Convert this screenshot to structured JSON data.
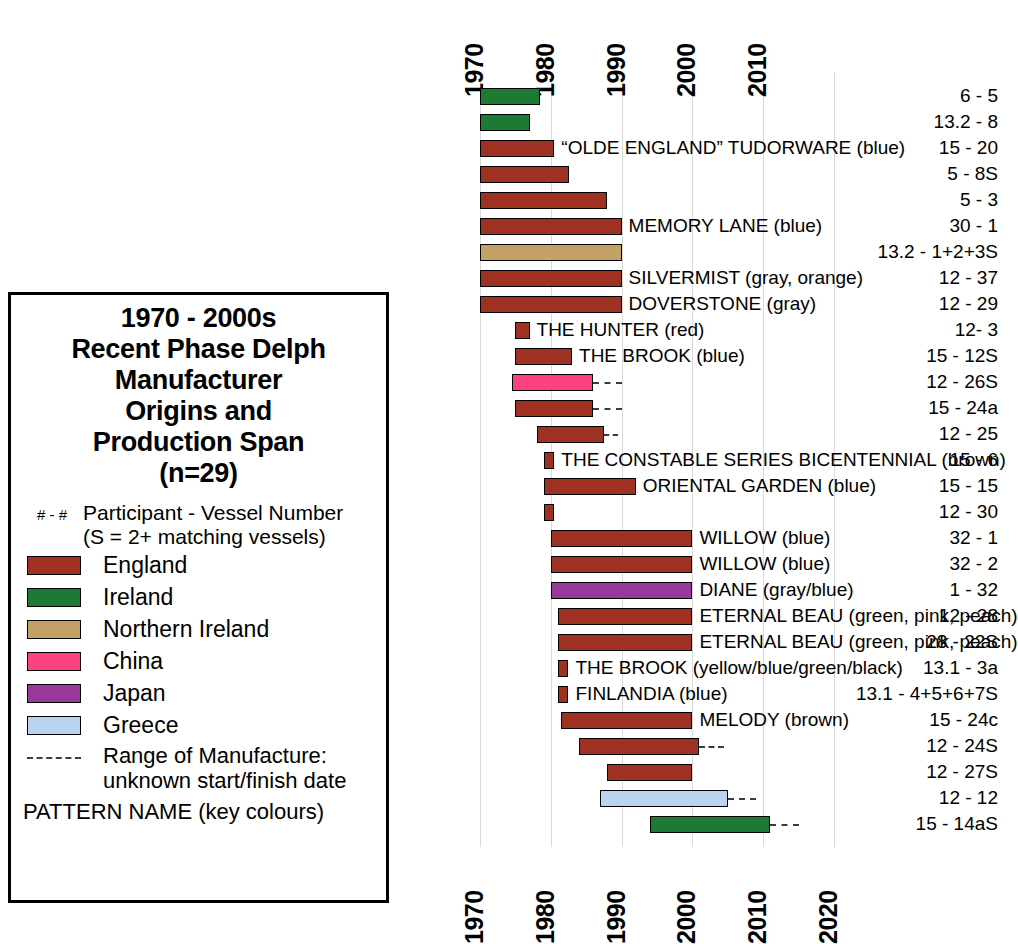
{
  "chart_data": {
    "type": "bar",
    "orientation": "horizontal-ranges",
    "n": 29,
    "xlabel": "",
    "ylabel": "Participant - Vessel Number",
    "xlim": [
      1970,
      2020
    ],
    "grid": true,
    "axis_top_ticks": [
      "1970",
      "1980",
      "1990",
      "2000",
      "2010"
    ],
    "axis_bottom_ticks": [
      "1970",
      "1980",
      "1990",
      "2000",
      "2010",
      "2020"
    ],
    "legend_position": "left-box",
    "colors": {
      "England": "#9e3122",
      "Ireland": "#1d7a32",
      "Northern Ireland": "#c4a265",
      "China": "#fc4380",
      "Japan": "#97389a",
      "Greece": "#b9d3f0"
    },
    "series": [
      {
        "label": "6 - 5",
        "origin": "Ireland",
        "start": 1970,
        "end": 1978.5,
        "dash_end": null,
        "pattern": ""
      },
      {
        "label": "13.2 - 8",
        "origin": "Ireland",
        "start": 1970,
        "end": 1977,
        "dash_end": null,
        "pattern": ""
      },
      {
        "label": "15 - 20",
        "origin": "England",
        "start": 1970,
        "end": 1980.5,
        "dash_end": null,
        "pattern": "“OLDE ENGLAND” TUDORWARE (blue)"
      },
      {
        "label": "5 - 8S",
        "origin": "England",
        "start": 1970,
        "end": 1982.5,
        "dash_end": null,
        "pattern": ""
      },
      {
        "label": "5 - 3",
        "origin": "England",
        "start": 1970,
        "end": 1988,
        "dash_end": null,
        "pattern": ""
      },
      {
        "label": "30 - 1",
        "origin": "England",
        "start": 1970,
        "end": 1990,
        "dash_end": null,
        "pattern": "MEMORY LANE (blue)"
      },
      {
        "label": "13.2 - 1+2+3S",
        "origin": "Northern Ireland",
        "start": 1970,
        "end": 1990,
        "dash_end": null,
        "pattern": ""
      },
      {
        "label": "12 - 37",
        "origin": "England",
        "start": 1970,
        "end": 1990,
        "dash_end": null,
        "pattern": "SILVERMIST (gray, orange)"
      },
      {
        "label": "12 - 29",
        "origin": "England",
        "start": 1970,
        "end": 1990,
        "dash_end": null,
        "pattern": "DOVERSTONE (gray)"
      },
      {
        "label": "12- 3",
        "origin": "England",
        "start": 1975,
        "end": 1977,
        "dash_end": null,
        "pattern": "THE HUNTER (red)"
      },
      {
        "label": "15 - 12S",
        "origin": "England",
        "start": 1975,
        "end": 1983,
        "dash_end": null,
        "pattern": "THE BROOK (blue)"
      },
      {
        "label": "12 - 26S",
        "origin": "China",
        "start": 1974.5,
        "end": 1986,
        "dash_end": 1990,
        "pattern": ""
      },
      {
        "label": "15 - 24a",
        "origin": "England",
        "start": 1975,
        "end": 1986,
        "dash_end": 1990,
        "pattern": ""
      },
      {
        "label": "12 - 25",
        "origin": "England",
        "start": 1978,
        "end": 1987.5,
        "dash_end": 1989.5,
        "pattern": ""
      },
      {
        "label": "15 - 6",
        "origin": "England",
        "start": 1979,
        "end": 1980.5,
        "dash_end": null,
        "pattern": "THE CONSTABLE SERIES BICENTENNIAL (brown)"
      },
      {
        "label": "15 - 15",
        "origin": "England",
        "start": 1979,
        "end": 1992,
        "dash_end": null,
        "pattern": "ORIENTAL GARDEN (blue)"
      },
      {
        "label": "12 - 30",
        "origin": "England",
        "start": 1979,
        "end": 1980.5,
        "dash_end": null,
        "pattern": ""
      },
      {
        "label": "32 - 1",
        "origin": "England",
        "start": 1980,
        "end": 2000,
        "dash_end": null,
        "pattern": "WILLOW (blue)"
      },
      {
        "label": "32 - 2",
        "origin": "England",
        "start": 1980,
        "end": 2000,
        "dash_end": null,
        "pattern": "WILLOW (blue)"
      },
      {
        "label": "1 - 32",
        "origin": "Japan",
        "start": 1980,
        "end": 2000,
        "dash_end": null,
        "pattern": "DIANE (gray/blue)"
      },
      {
        "label": "12 - 28",
        "origin": "England",
        "start": 1981,
        "end": 2000,
        "dash_end": null,
        "pattern": "ETERNAL BEAU (green, pink, peach)"
      },
      {
        "label": "28 - 22S",
        "origin": "England",
        "start": 1981,
        "end": 2000,
        "dash_end": null,
        "pattern": "ETERNAL BEAU (green, pink, peach)"
      },
      {
        "label": "13.1 - 3a",
        "origin": "England",
        "start": 1981,
        "end": 1982.5,
        "dash_end": null,
        "pattern": "THE BROOK (yellow/blue/green/black)"
      },
      {
        "label": "13.1 - 4+5+6+7S",
        "origin": "England",
        "start": 1981,
        "end": 1982.5,
        "dash_end": null,
        "pattern": "FINLANDIA (blue)"
      },
      {
        "label": "15 - 24c",
        "origin": "England",
        "start": 1981.5,
        "end": 2000,
        "dash_end": null,
        "pattern": "MELODY (brown)"
      },
      {
        "label": "12 - 24S",
        "origin": "England",
        "start": 1984,
        "end": 2001,
        "dash_end": 2004.5,
        "pattern": ""
      },
      {
        "label": "12 - 27S",
        "origin": "England",
        "start": 1988,
        "end": 2000,
        "dash_end": null,
        "pattern": ""
      },
      {
        "label": "12 - 12",
        "origin": "Greece",
        "start": 1987,
        "end": 2005,
        "dash_end": 2009,
        "pattern": ""
      },
      {
        "label": "15 - 14aS",
        "origin": "Ireland",
        "start": 1994,
        "end": 2011,
        "dash_end": 2015,
        "pattern": ""
      }
    ]
  },
  "legend": {
    "title_lines": [
      "1970 - 2000s",
      "Recent Phase Delph",
      "Manufacturer",
      "Origins and",
      "Production Span",
      "(n=29)"
    ],
    "key_symbol": "# - #",
    "key_text_line1": "Participant - Vessel Number",
    "key_text_line2": "(S = 2+ matching vessels)",
    "items": [
      {
        "label": "England",
        "color": "#9e3122"
      },
      {
        "label": "Ireland",
        "color": "#1d7a32"
      },
      {
        "label": "Northern Ireland",
        "color": "#c4a265"
      },
      {
        "label": "China",
        "color": "#fc4380"
      },
      {
        "label": "Japan",
        "color": "#97389a"
      },
      {
        "label": "Greece",
        "color": "#b9d3f0"
      }
    ],
    "dash_text_line1": "Range of Manufacture:",
    "dash_text_line2": "unknown start/finish date",
    "footer": "PATTERN NAME (key colours)"
  }
}
